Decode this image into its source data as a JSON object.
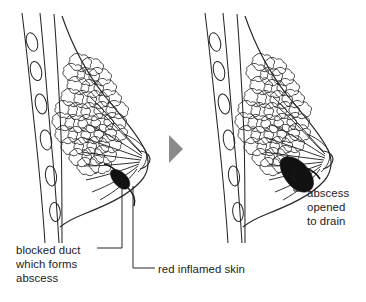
{
  "figure": {
    "background_color": "#ffffff",
    "ink_color": "#1b1b1b",
    "arrow_color": "#8a8a8a",
    "abscess_fill": "#111111"
  },
  "panels": [
    {
      "id": "left-panel",
      "name": "breast-with-blocked-duct",
      "stage": "before",
      "parts": [
        "chest-wall",
        "ribs",
        "breast-outline",
        "glandular-lobules",
        "milk-ducts",
        "nipple",
        "abscess"
      ]
    },
    {
      "id": "right-panel",
      "name": "breast-with-drained-abscess",
      "stage": "after",
      "parts": [
        "chest-wall",
        "ribs",
        "breast-outline",
        "glandular-lobules",
        "milk-ducts",
        "nipple",
        "abscess-opened"
      ]
    }
  ],
  "arrow": {
    "name": "progression-arrow",
    "direction": "right",
    "color": "#8a8a8a"
  },
  "labels": {
    "blocked_duct": "blocked duct\nwhich forms\nabscess",
    "blocked_duct_lines": [
      "blocked duct",
      "which forms",
      "abscess"
    ],
    "red_inflamed_skin": "red inflamed skin",
    "abscess_opened": "abscess\nopened\nto drain",
    "abscess_opened_lines": [
      "abscess",
      "opened",
      "to drain"
    ]
  },
  "leaders": [
    {
      "name": "leader-blocked-duct",
      "from": "blocked duct label",
      "to": "abscess in left breast"
    },
    {
      "name": "leader-red-inflamed-skin",
      "from": "red inflamed skin label",
      "to": "skin over abscess"
    },
    {
      "name": "leader-abscess-opened",
      "from": "abscess opened to drain label",
      "to": "abscess in right breast"
    }
  ]
}
